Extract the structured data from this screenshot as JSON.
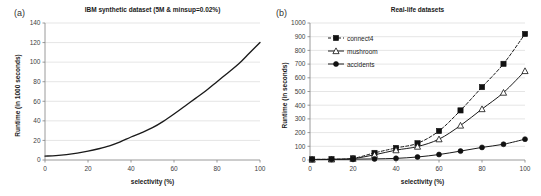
{
  "figure": {
    "panel_a_label": "(a)",
    "panel_b_label": "(b)"
  },
  "chart_data": [
    {
      "type": "line",
      "panel": "(a)",
      "title": "IBM synthetic dataset (5M & minsup=0.02%)",
      "xlabel": "selectivity (%)",
      "ylabel": "Runtime (in 1000 seconds)",
      "xlim": [
        0,
        100
      ],
      "ylim": [
        0,
        140
      ],
      "xticks": [
        0,
        20,
        40,
        60,
        80,
        100
      ],
      "yticks": [
        0,
        20,
        40,
        60,
        80,
        100,
        120,
        140
      ],
      "grid": "horizontal",
      "legend": "none",
      "series": [
        {
          "name": "IBM synthetic",
          "marker": "none",
          "linestyle": "solid",
          "color": "#1a1a1a",
          "x": [
            0,
            5,
            10,
            15,
            20,
            25,
            30,
            35,
            40,
            45,
            50,
            55,
            60,
            65,
            70,
            75,
            80,
            85,
            90,
            95,
            100
          ],
          "values": [
            4,
            4.5,
            5.5,
            7,
            9,
            11.5,
            14.5,
            18.5,
            23.5,
            28,
            33,
            39.5,
            47,
            55,
            63,
            71,
            80,
            89,
            98,
            109,
            120
          ]
        }
      ]
    },
    {
      "type": "line",
      "panel": "(b)",
      "title": "Real-life datasets",
      "xlabel": "selectivity (%)",
      "ylabel": "Runtime (in seconds)",
      "xlim": [
        0,
        100
      ],
      "ylim": [
        0,
        1000
      ],
      "xticks": [
        0,
        20,
        40,
        60,
        80,
        100
      ],
      "yticks": [
        0,
        100,
        200,
        300,
        400,
        500,
        600,
        700,
        800,
        900,
        1000
      ],
      "grid": "horizontal",
      "legend": "upper-left-inside",
      "x": [
        1,
        10,
        20,
        30,
        40,
        50,
        60,
        70,
        80,
        90,
        100
      ],
      "series": [
        {
          "name": "connect4",
          "marker": "filled-square",
          "linestyle": "dashed",
          "color": "#1a1a1a",
          "values": [
            5,
            6,
            12,
            52,
            88,
            122,
            212,
            362,
            532,
            702,
            920
          ]
        },
        {
          "name": "mushroom",
          "marker": "open-triangle",
          "linestyle": "solid",
          "color": "#1a1a1a",
          "values": [
            4,
            5,
            10,
            38,
            72,
            98,
            152,
            252,
            372,
            492,
            650
          ]
        },
        {
          "name": "accidents",
          "marker": "filled-circle",
          "linestyle": "solid",
          "color": "#1a1a1a",
          "values": [
            3,
            4,
            6,
            8,
            12,
            22,
            40,
            65,
            92,
            115,
            152
          ]
        }
      ]
    }
  ]
}
